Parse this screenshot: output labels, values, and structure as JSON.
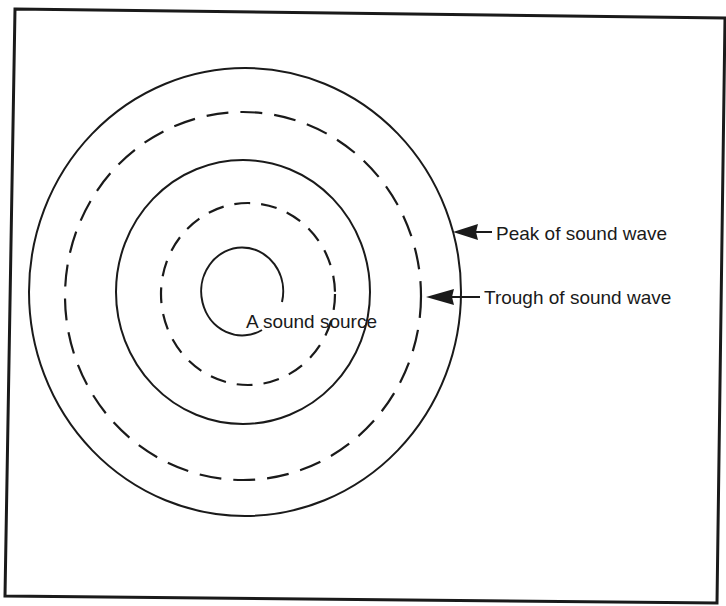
{
  "diagram": {
    "source_label": "A sound source",
    "peak_label": "Peak of sound wave",
    "trough_label": "Trough of sound wave",
    "rings": [
      {
        "type": "peak",
        "style": "solid",
        "rx": 216,
        "ry": 224
      },
      {
        "type": "trough",
        "style": "dashed",
        "rx": 178,
        "ry": 184
      },
      {
        "type": "peak",
        "style": "solid",
        "rx": 127,
        "ry": 132
      },
      {
        "type": "trough",
        "style": "dashed",
        "rx": 87,
        "ry": 91
      },
      {
        "type": "peak",
        "style": "solid-open",
        "rx": 42,
        "ry": 44
      }
    ],
    "colors": {
      "ink": "#1a1a1a",
      "background": "#ffffff"
    }
  }
}
